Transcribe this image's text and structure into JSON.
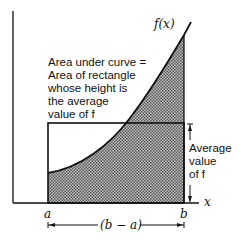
{
  "diagram": {
    "curve_label": "f(x)",
    "axis_x_label": "x",
    "point_a_label": "a",
    "point_b_label": "b",
    "width_label": "(b − a)",
    "annotation_lines": [
      "Area under curve =",
      "Area of rectangle",
      "whose height is",
      "the average",
      "value of f"
    ],
    "height_label_lines": [
      "Average",
      "value",
      "of f"
    ],
    "colors": {
      "line": "#111111",
      "shade": "#8a8a8a",
      "background": "#ffffff"
    }
  }
}
